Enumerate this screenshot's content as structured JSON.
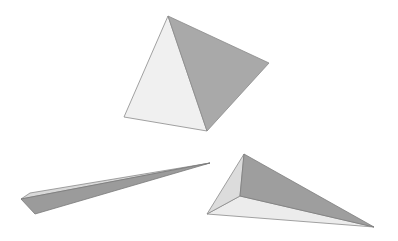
{
  "scene": {
    "width": 398,
    "height": 241,
    "background": "#ffffff",
    "shapes": [
      {
        "name": "tetrahedron-top",
        "faces": [
          {
            "name": "left-face",
            "points": "168,16 124,117 207,131",
            "fill": "#f0f0f0",
            "stroke": "#8a8a8a"
          },
          {
            "name": "right-face",
            "points": "168,16 269,63 207,131",
            "fill": "#a9a9a9",
            "stroke": "#8a8a8a"
          }
        ]
      },
      {
        "name": "sliver-prism-left",
        "faces": [
          {
            "name": "top-face",
            "points": "21,199 30,193 210,163",
            "fill": "#d9d9d9",
            "stroke": "#8a8a8a"
          },
          {
            "name": "side-face",
            "points": "21,199 35,214 210,163",
            "fill": "#9b9b9b",
            "stroke": "#7a7a7a"
          }
        ]
      },
      {
        "name": "pyramid-bottom-right",
        "faces": [
          {
            "name": "left-face",
            "points": "244,154 207,214 240,196",
            "fill": "#dcdcdc",
            "stroke": "#8a8a8a"
          },
          {
            "name": "top-face",
            "points": "244,154 240,196 374,227",
            "fill": "#9e9e9e",
            "stroke": "#7e7e7e"
          },
          {
            "name": "bottom-face",
            "points": "207,214 240,196 374,227",
            "fill": "#ececec",
            "stroke": "#8a8a8a"
          }
        ]
      }
    ]
  }
}
